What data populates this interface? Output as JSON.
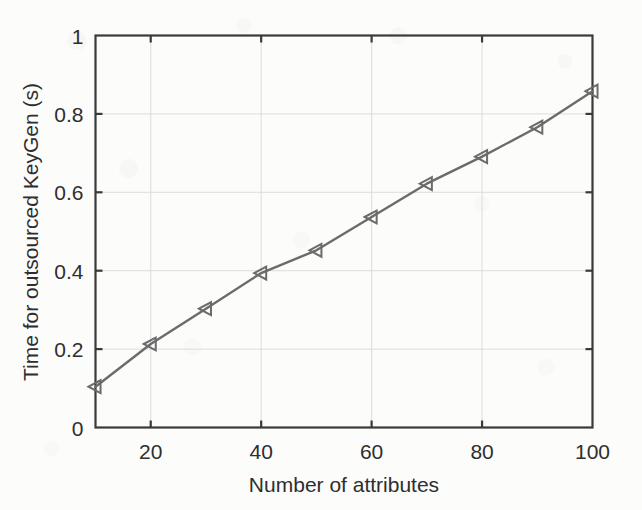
{
  "chart_data": {
    "type": "line",
    "title": "",
    "xlabel": "Number of attributes",
    "ylabel": "Time for outsourced KeyGen (s)",
    "xlim": [
      10,
      100
    ],
    "ylim": [
      0,
      1
    ],
    "grid": true,
    "legend": null,
    "marker": "left-triangle",
    "line_color": "#6b6b6b",
    "marker_color": "#6b6b6b",
    "grid_color": "#dcdcdc",
    "axis_color": "#3a3a3a",
    "x_ticks": [
      "20",
      "40",
      "60",
      "80",
      "100"
    ],
    "x_tick_values": [
      20,
      40,
      60,
      80,
      100
    ],
    "y_ticks": [
      "0",
      "0.2",
      "0.4",
      "0.6",
      "0.8",
      "1"
    ],
    "y_tick_values": [
      0,
      0.2,
      0.4,
      0.6,
      0.8,
      1
    ],
    "x": [
      10,
      20,
      30,
      40,
      50,
      60,
      70,
      80,
      90,
      100
    ],
    "values": [
      0.104,
      0.213,
      0.303,
      0.394,
      0.452,
      0.537,
      0.622,
      0.691,
      0.766,
      0.858
    ],
    "series": [
      {
        "name": "Outsourced KeyGen time",
        "x": [
          10,
          20,
          30,
          40,
          50,
          60,
          70,
          80,
          90,
          100
        ],
        "values": [
          0.104,
          0.213,
          0.303,
          0.394,
          0.452,
          0.537,
          0.622,
          0.691,
          0.766,
          0.858
        ]
      }
    ]
  },
  "figure": {
    "background_color": "#fcfcfb"
  }
}
